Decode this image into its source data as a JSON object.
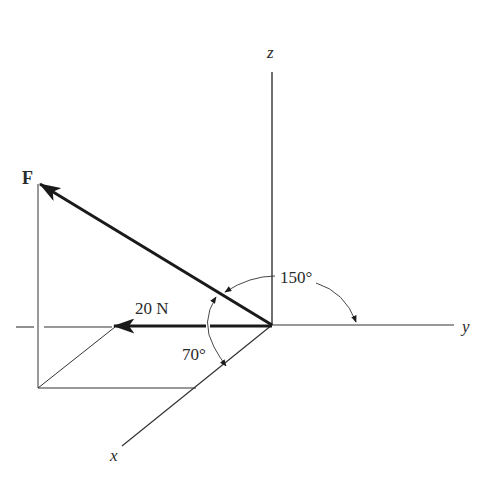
{
  "diagram": {
    "type": "3d-force-vector",
    "axes": {
      "x": {
        "label": "x"
      },
      "y": {
        "label": "y"
      },
      "z": {
        "label": "z"
      }
    },
    "vectors": [
      {
        "name": "F",
        "label": "F",
        "description": "force vector pointing up-left out of origin"
      },
      {
        "name": "projection",
        "label": "20 N",
        "description": "component along negative y direction"
      }
    ],
    "angles": [
      {
        "label": "150°",
        "between": "F and +y axis"
      },
      {
        "label": "70°",
        "between": "F and +x axis"
      }
    ],
    "colors": {
      "line": "#2a2a2a",
      "background": "#ffffff"
    }
  }
}
